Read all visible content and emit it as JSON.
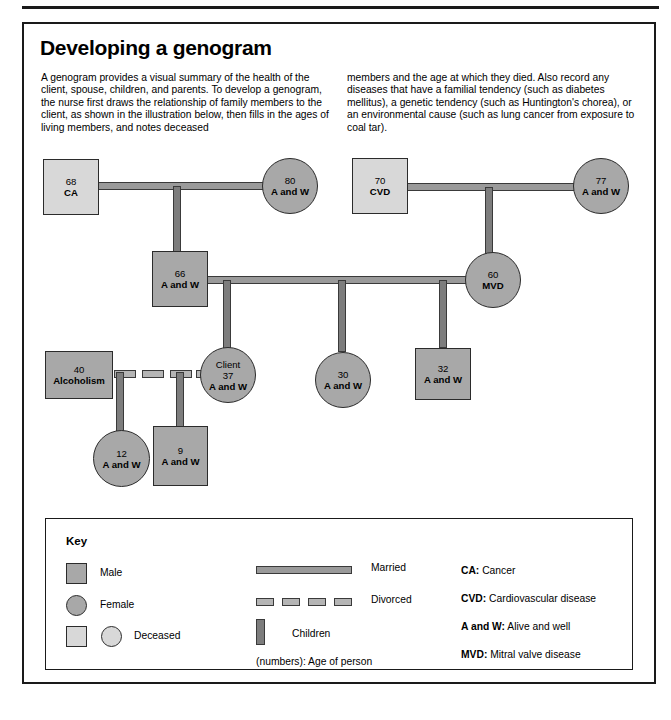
{
  "page": {
    "title": "Developing a genogram",
    "intro_left": "A genogram provides a visual summary of the health of the client, spouse, children, and parents. To develop a genogram, the nurse first draws the relationship of family members to the client, as shown in the illustration below, then fills in the ages of living members, and notes deceased",
    "intro_right": "members and the age at which they died. Also record any diseases that have a familial tendency (such as diabetes mellitus), a genetic tendency (such as Huntington's chorea), or an environmental cause (such as lung cancer from exposure to coal tar).",
    "caption": ""
  },
  "genogram": {
    "nodes": [
      {
        "id": "gf-paternal",
        "shape": "square",
        "deceased": true,
        "age": "68",
        "cond": "CA",
        "label": ""
      },
      {
        "id": "gm-paternal",
        "shape": "circle",
        "deceased": false,
        "age": "80",
        "cond": "A and W",
        "label": ""
      },
      {
        "id": "gf-maternal",
        "shape": "square",
        "deceased": true,
        "age": "70",
        "cond": "CVD",
        "label": ""
      },
      {
        "id": "gm-maternal",
        "shape": "circle",
        "deceased": false,
        "age": "77",
        "cond": "A and W",
        "label": ""
      },
      {
        "id": "father",
        "shape": "square",
        "deceased": false,
        "age": "66",
        "cond": "A and W",
        "label": ""
      },
      {
        "id": "mother",
        "shape": "circle",
        "deceased": false,
        "age": "60",
        "cond": "MVD",
        "label": ""
      },
      {
        "id": "ex-spouse",
        "shape": "square",
        "deceased": false,
        "age": "40",
        "cond": "Alcoholism",
        "label": ""
      },
      {
        "id": "client",
        "shape": "circle",
        "deceased": false,
        "age": "37",
        "cond": "A and W",
        "label": "Client"
      },
      {
        "id": "sibling-30",
        "shape": "circle",
        "deceased": false,
        "age": "30",
        "cond": "A and W",
        "label": ""
      },
      {
        "id": "sibling-32",
        "shape": "square",
        "deceased": false,
        "age": "32",
        "cond": "A and W",
        "label": ""
      },
      {
        "id": "child-12",
        "shape": "circle",
        "deceased": false,
        "age": "12",
        "cond": "A and W",
        "label": ""
      },
      {
        "id": "child-9",
        "shape": "square",
        "deceased": false,
        "age": "9",
        "cond": "A and W",
        "label": ""
      }
    ]
  },
  "key": {
    "title": "Key",
    "shapes": [
      {
        "name": "male",
        "label": "Male"
      },
      {
        "name": "female",
        "label": "Female"
      },
      {
        "name": "deceased",
        "label": "Deceased"
      }
    ],
    "lines": [
      {
        "name": "married",
        "label": "Married"
      },
      {
        "name": "divorced",
        "label": "Divorced"
      },
      {
        "name": "children",
        "label": "Children"
      }
    ],
    "numbers_note": "(numbers): Age of person",
    "abbreviations": [
      {
        "abbr": "CA:",
        "meaning": "Cancer"
      },
      {
        "abbr": "CVD:",
        "meaning": "Cardiovascular disease"
      },
      {
        "abbr": "A and W:",
        "meaning": "Alive and well"
      },
      {
        "abbr": "MVD:",
        "meaning": "Mitral valve disease"
      }
    ]
  },
  "colors": {
    "fill_alive": "#a8a8a8",
    "fill_deceased": "#d8d8d8",
    "stroke": "#2b2b2b",
    "connector": "#9a9a9a",
    "connector_vertical": "#7d7d7d"
  }
}
